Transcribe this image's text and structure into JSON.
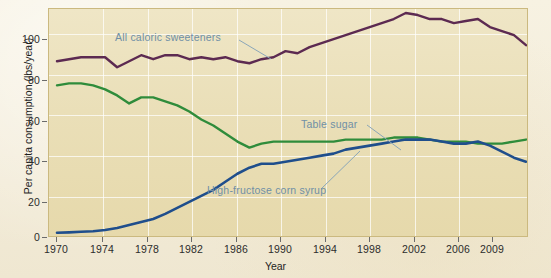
{
  "chart_data": {
    "type": "line",
    "title": "",
    "xlabel": "Year",
    "ylabel": "Per capita consumption (lbs/year)",
    "xlim": [
      1970,
      2009
    ],
    "ylim": [
      0,
      112
    ],
    "grid": true,
    "legend": "annotations-inline",
    "xticks": [
      1970,
      1974,
      1978,
      1982,
      1986,
      1990,
      1994,
      1998,
      2002,
      2006,
      2009
    ],
    "xtick_labels": [
      "1970",
      "1974",
      "1978",
      "1982",
      "1986",
      "1990",
      "1994",
      "1998",
      "2002",
      "2006",
      "2009"
    ],
    "yticks": [
      0,
      20,
      40,
      60,
      80,
      100
    ],
    "ytick_labels": [
      "0",
      "20",
      "40",
      "60",
      "80",
      "100"
    ],
    "x": [
      1970,
      1971,
      1972,
      1973,
      1974,
      1975,
      1976,
      1977,
      1978,
      1979,
      1980,
      1981,
      1982,
      1983,
      1984,
      1985,
      1986,
      1987,
      1988,
      1989,
      1990,
      1991,
      1992,
      1993,
      1994,
      1995,
      1996,
      1997,
      1998,
      1999,
      2000,
      2001,
      2002,
      2003,
      2004,
      2005,
      2006,
      2007,
      2008,
      2009
    ],
    "series": [
      {
        "name": "All caloric sweeteners",
        "color": "#5c2a51",
        "values": [
          86,
          87,
          88,
          88,
          88,
          83,
          86,
          89,
          87,
          89,
          89,
          87,
          88,
          87,
          88,
          86,
          85,
          87,
          88,
          91,
          90,
          93,
          95,
          97,
          99,
          101,
          103,
          105,
          107,
          110,
          109,
          107,
          107,
          105,
          106,
          107,
          103,
          101,
          99,
          94
        ]
      },
      {
        "name": "Table sugar",
        "color": "#2f8c3b",
        "values": [
          74,
          75,
          75,
          74,
          72,
          69,
          65,
          68,
          68,
          66,
          64,
          61,
          57,
          54,
          50,
          46,
          43,
          45,
          46,
          46,
          46,
          46,
          46,
          46,
          47,
          47,
          47,
          47,
          48,
          48,
          48,
          47,
          46,
          46,
          46,
          45,
          45,
          45,
          46,
          47
        ]
      },
      {
        "name": "High-fructose corn syrup",
        "color": "#1f4e8c",
        "values": [
          0.6,
          0.8,
          1.1,
          1.4,
          2,
          3,
          4.5,
          6,
          7.5,
          10,
          13,
          16,
          19,
          22,
          26,
          30,
          33,
          35,
          35,
          36,
          37,
          38,
          39,
          40,
          42,
          43,
          44,
          45,
          46,
          47,
          47,
          47,
          46,
          45,
          45,
          46,
          44,
          41,
          38,
          36
        ]
      }
    ],
    "annotations": [
      {
        "text": "All caloric sweeteners",
        "color": "#6f8fa6"
      },
      {
        "text": "Table sugar",
        "color": "#6f8fa6"
      },
      {
        "text": "High-fructose corn syrup",
        "color": "#6f8fa6"
      }
    ]
  }
}
